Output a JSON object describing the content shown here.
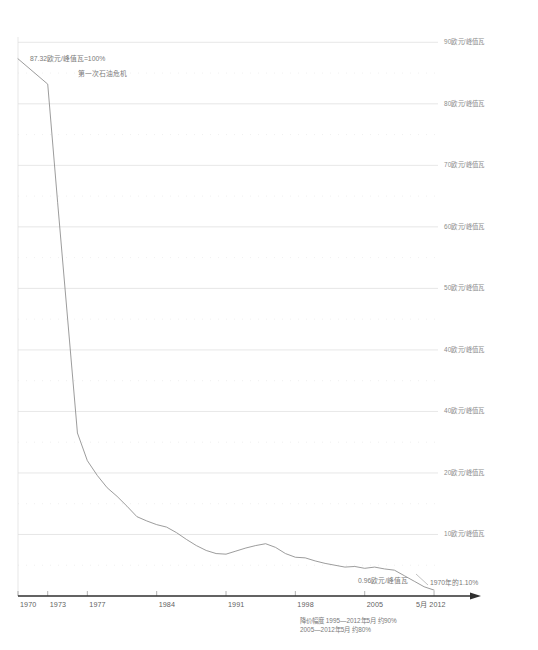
{
  "chart_data": {
    "type": "line",
    "title": "",
    "xlabel": "",
    "ylabel": "",
    "ylim": [
      0,
      92
    ],
    "xlim": [
      1970,
      2012.4
    ],
    "grid": true,
    "legend_position": "none",
    "y_axis_position": "right",
    "y_ticks": [
      {
        "value": 90,
        "label": "90欧元/峰值瓦"
      },
      {
        "value": 80,
        "label": "80欧元/峰值瓦"
      },
      {
        "value": 70,
        "label": "70欧元/峰值瓦"
      },
      {
        "value": 60,
        "label": "60欧元/峰值瓦"
      },
      {
        "value": 50,
        "label": "50欧元/峰值瓦"
      },
      {
        "value": 40,
        "label": "40欧元/峰值瓦"
      },
      {
        "value": 30,
        "label": "40欧元/峰值瓦"
      },
      {
        "value": 20,
        "label": "20欧元/峰值瓦"
      },
      {
        "value": 10,
        "label": "10欧元/峰值瓦"
      }
    ],
    "x_ticks": [
      {
        "value": 1970,
        "label": "1970"
      },
      {
        "value": 1973,
        "label": "1973"
      },
      {
        "value": 1977,
        "label": "1977"
      },
      {
        "value": 1984,
        "label": "1984"
      },
      {
        "value": 1991,
        "label": "1991"
      },
      {
        "value": 1998,
        "label": "1998"
      },
      {
        "value": 2005,
        "label": "2005"
      },
      {
        "value": 2012,
        "label": "5月 2012"
      }
    ],
    "series": [
      {
        "name": "组件价格",
        "color": "#8a8a8a",
        "x": [
          1970,
          1973,
          1974,
          1976,
          1977,
          1978,
          1979,
          1980,
          1981,
          1982,
          1983,
          1984,
          1985,
          1986,
          1987,
          1988,
          1989,
          1990,
          1991,
          1992,
          1993,
          1994,
          1995,
          1996,
          1997,
          1998,
          1999,
          2000,
          2001,
          2002,
          2003,
          2004,
          2005,
          2006,
          2007,
          2008,
          2009,
          2010,
          2011,
          2012
        ],
        "values": [
          87.32,
          83.2,
          64.0,
          26.5,
          22.0,
          19.6,
          17.6,
          16.2,
          14.6,
          12.9,
          12.2,
          11.6,
          11.2,
          10.3,
          9.2,
          8.2,
          7.4,
          6.9,
          6.8,
          7.3,
          7.8,
          8.2,
          8.5,
          7.9,
          6.9,
          6.3,
          6.2,
          5.7,
          5.3,
          5.0,
          4.7,
          4.8,
          4.5,
          4.7,
          4.4,
          4.2,
          3.3,
          2.4,
          1.5,
          0.96
        ]
      }
    ],
    "annotations": [
      {
        "name": "start-value",
        "text": "87.32欧元/峰值瓦=100%"
      },
      {
        "name": "oil-crisis",
        "text": "第一次石油危机"
      },
      {
        "name": "end-value",
        "text": "0.96欧元/峰值瓦"
      },
      {
        "name": "end-percent",
        "text": "1970年的1.10%"
      }
    ],
    "footnotes": [
      "降价幅度 1995—2012年5月 约90%",
      "2005—2012年5月 约80%"
    ],
    "colors": {
      "line": "#8a8a8a",
      "gridline": "#dddddd",
      "dotted_grid": "#e8e8e8",
      "axis": "#2f2f2f",
      "text": "#7a7a7a"
    }
  }
}
